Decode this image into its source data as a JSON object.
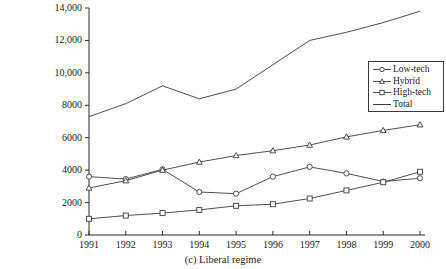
{
  "caption": "(c) Liberal regime",
  "legend": {
    "position": "right-upper",
    "items": [
      {
        "label": "Low-tech",
        "marker": "circle-marker-icon"
      },
      {
        "label": "Hybrid",
        "marker": "triangle-marker-icon"
      },
      {
        "label": "High-tech",
        "marker": "square-marker-icon"
      },
      {
        "label": "Total",
        "marker": "plain-line-icon"
      }
    ]
  },
  "axes": {
    "y_ticks": [
      "0",
      "2000",
      "4000",
      "6000",
      "8000",
      "10,000",
      "12,000",
      "14,000"
    ],
    "x_ticks": [
      "1991",
      "1992",
      "1993",
      "1994",
      "1995",
      "1996",
      "1997",
      "1998",
      "1999",
      "2000"
    ]
  },
  "chart_data": {
    "type": "line",
    "title": "(c) Liberal regime",
    "xlabel": "",
    "ylabel": "",
    "grid": false,
    "legend_position": "right-upper",
    "ylim": [
      0,
      14000
    ],
    "yticks": [
      0,
      2000,
      4000,
      6000,
      8000,
      10000,
      12000,
      14000
    ],
    "categories": [
      1991,
      1992,
      1993,
      1994,
      1995,
      1996,
      1997,
      1998,
      1999,
      2000
    ],
    "x": [
      1991,
      1992,
      1993,
      1994,
      1995,
      1996,
      1997,
      1998,
      1999,
      2000
    ],
    "series": [
      {
        "name": "Low-tech",
        "marker": "circle",
        "values": [
          3600,
          3450,
          4050,
          2650,
          2550,
          3600,
          4200,
          3800,
          3300,
          3500
        ]
      },
      {
        "name": "Hybrid",
        "marker": "triangle",
        "values": [
          2900,
          3350,
          4000,
          4500,
          4900,
          5200,
          5550,
          6050,
          6450,
          6800
        ]
      },
      {
        "name": "High-tech",
        "marker": "square",
        "values": [
          1000,
          1200,
          1350,
          1550,
          1800,
          1900,
          2250,
          2750,
          3250,
          3900
        ]
      },
      {
        "name": "Total",
        "marker": "none",
        "values": [
          7300,
          8100,
          9200,
          8400,
          9000,
          10500,
          12000,
          12500,
          13100,
          13800
        ]
      }
    ]
  },
  "colors": {
    "line": "#3a3a3a",
    "axis": "#2b2b2b",
    "background": "#ffffff"
  }
}
